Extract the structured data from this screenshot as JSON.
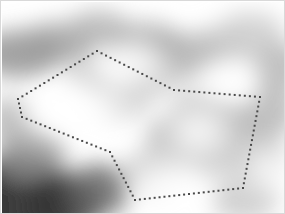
{
  "view": {
    "title": "Dotted Polygon Region Annotation",
    "width": 285,
    "height": 214,
    "border_color": "#d9d9d9",
    "background_color": "#ffffff"
  },
  "heatmap": {
    "name": "grayscale-blurred-density-field",
    "colormap": "grayscale",
    "min_color": "#ffffff",
    "max_color": "#111111",
    "blur_px": 14,
    "description": "Smooth blurred grayscale scalar field with dark bands framing a bright interior region",
    "blobs": [
      {
        "cx": 14,
        "cy": 196,
        "rx": 62,
        "ry": 44,
        "level": 0.95
      },
      {
        "cx": 60,
        "cy": 205,
        "rx": 40,
        "ry": 30,
        "level": 0.8
      },
      {
        "cx": 96,
        "cy": 188,
        "rx": 34,
        "ry": 26,
        "level": 0.62
      },
      {
        "cx": 30,
        "cy": 150,
        "rx": 34,
        "ry": 26,
        "level": 0.42
      },
      {
        "cx": 8,
        "cy": 118,
        "rx": 26,
        "ry": 22,
        "level": 0.3
      },
      {
        "cx": 18,
        "cy": 52,
        "rx": 44,
        "ry": 24,
        "level": 0.44
      },
      {
        "cx": 58,
        "cy": 40,
        "rx": 40,
        "ry": 20,
        "level": 0.38
      },
      {
        "cx": 96,
        "cy": 26,
        "rx": 30,
        "ry": 18,
        "level": 0.3
      },
      {
        "cx": 140,
        "cy": 40,
        "rx": 40,
        "ry": 20,
        "level": 0.34
      },
      {
        "cx": 178,
        "cy": 54,
        "rx": 42,
        "ry": 22,
        "level": 0.36
      },
      {
        "cx": 216,
        "cy": 46,
        "rx": 36,
        "ry": 20,
        "level": 0.26
      },
      {
        "cx": 248,
        "cy": 30,
        "rx": 34,
        "ry": 20,
        "level": 0.2
      },
      {
        "cx": 276,
        "cy": 66,
        "rx": 28,
        "ry": 26,
        "level": 0.3
      },
      {
        "cx": 268,
        "cy": 110,
        "rx": 26,
        "ry": 26,
        "level": 0.3
      },
      {
        "cx": 252,
        "cy": 150,
        "rx": 28,
        "ry": 26,
        "level": 0.28
      },
      {
        "cx": 222,
        "cy": 118,
        "rx": 30,
        "ry": 22,
        "level": 0.3
      },
      {
        "cx": 196,
        "cy": 104,
        "rx": 26,
        "ry": 18,
        "level": 0.24
      },
      {
        "cx": 172,
        "cy": 136,
        "rx": 28,
        "ry": 22,
        "level": 0.3
      },
      {
        "cx": 200,
        "cy": 156,
        "rx": 30,
        "ry": 20,
        "level": 0.26
      },
      {
        "cx": 150,
        "cy": 170,
        "rx": 30,
        "ry": 22,
        "level": 0.22
      },
      {
        "cx": 118,
        "cy": 96,
        "rx": 34,
        "ry": 22,
        "level": 0.18
      },
      {
        "cx": 150,
        "cy": 78,
        "rx": 26,
        "ry": 16,
        "level": 0.22
      },
      {
        "cx": 84,
        "cy": 74,
        "rx": 22,
        "ry": 16,
        "level": 0.2
      },
      {
        "cx": 242,
        "cy": 196,
        "rx": 34,
        "ry": 24,
        "level": 0.22
      }
    ],
    "highlights": [
      {
        "cx": 70,
        "cy": 110,
        "rx": 48,
        "ry": 26
      },
      {
        "cx": 132,
        "cy": 60,
        "rx": 34,
        "ry": 20
      },
      {
        "cx": 196,
        "cy": 130,
        "rx": 30,
        "ry": 22
      },
      {
        "cx": 226,
        "cy": 78,
        "rx": 30,
        "ry": 18
      },
      {
        "cx": 168,
        "cy": 186,
        "rx": 40,
        "ry": 24
      },
      {
        "cx": 264,
        "cy": 166,
        "rx": 22,
        "ry": 20
      }
    ]
  },
  "annotation": {
    "name": "dotted-polygon-roi",
    "shape": "polygon",
    "style": "dotted",
    "dot_color": "#4a4a4a",
    "dot_size_px": 2,
    "dot_spacing_px": 5,
    "closed": true,
    "vertices": [
      {
        "x": 95,
        "y": 49
      },
      {
        "x": 172,
        "y": 88
      },
      {
        "x": 258,
        "y": 95
      },
      {
        "x": 241,
        "y": 186
      },
      {
        "x": 133,
        "y": 198
      },
      {
        "x": 108,
        "y": 150
      },
      {
        "x": 20,
        "y": 115
      },
      {
        "x": 16,
        "y": 97
      }
    ]
  }
}
